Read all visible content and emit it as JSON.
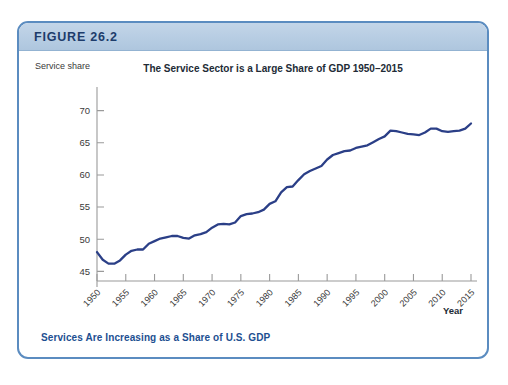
{
  "figure": {
    "label": "FIGURE 26.2",
    "caption": "Services Are Increasing as a Share of U.S. GDP",
    "border_color": "#5b8cc0",
    "header_color": "#b7cde3",
    "caption_color": "#1d4f91"
  },
  "chart_data": {
    "type": "line",
    "title": "The Service Sector is a Large Share of GDP 1950–2015",
    "xlabel": "Year",
    "ylabel": "Service share",
    "line_color": "#2b3f87",
    "grid": false,
    "legend": null,
    "xlim": [
      1950,
      2015
    ],
    "ylim": [
      43.5,
      71.5
    ],
    "xticks": [
      1950,
      1955,
      1960,
      1965,
      1970,
      1975,
      1980,
      1985,
      1990,
      1995,
      2000,
      2005,
      2010,
      2015
    ],
    "xtick_labels": [
      "1950",
      "1955",
      "1960",
      "1965",
      "1970",
      "1975",
      "1980",
      "1985",
      "1990",
      "1995",
      "2000",
      "2005",
      "2010",
      "2015"
    ],
    "yticks": [
      45,
      50,
      55,
      60,
      65,
      70
    ],
    "ytick_labels": [
      "45",
      "50",
      "55",
      "60",
      "65",
      "70"
    ],
    "x": [
      1950,
      1951,
      1952,
      1953,
      1954,
      1955,
      1956,
      1957,
      1958,
      1959,
      1960,
      1961,
      1962,
      1963,
      1964,
      1965,
      1966,
      1967,
      1968,
      1969,
      1970,
      1971,
      1972,
      1973,
      1974,
      1975,
      1976,
      1977,
      1978,
      1979,
      1980,
      1981,
      1982,
      1983,
      1984,
      1985,
      1986,
      1987,
      1988,
      1989,
      1990,
      1991,
      1992,
      1993,
      1994,
      1995,
      1996,
      1997,
      1998,
      1999,
      2000,
      2001,
      2002,
      2003,
      2004,
      2005,
      2006,
      2007,
      2008,
      2009,
      2010,
      2011,
      2012,
      2013,
      2014,
      2015
    ],
    "values": [
      48.0,
      46.8,
      46.2,
      46.2,
      46.7,
      47.6,
      48.2,
      48.4,
      48.4,
      49.3,
      49.7,
      50.1,
      50.3,
      50.5,
      50.5,
      50.2,
      50.1,
      50.6,
      50.8,
      51.1,
      51.8,
      52.3,
      52.4,
      52.3,
      52.6,
      53.6,
      53.9,
      54.0,
      54.2,
      54.6,
      55.5,
      55.9,
      57.3,
      58.1,
      58.2,
      59.2,
      60.1,
      60.6,
      61.0,
      61.4,
      62.4,
      63.1,
      63.4,
      63.7,
      63.8,
      64.2,
      64.4,
      64.6,
      65.1,
      65.6,
      66.0,
      66.9,
      66.8,
      66.6,
      66.4,
      66.3,
      66.2,
      66.6,
      67.2,
      67.2,
      66.8,
      66.7,
      66.8,
      66.9,
      67.2,
      68.0
    ]
  }
}
